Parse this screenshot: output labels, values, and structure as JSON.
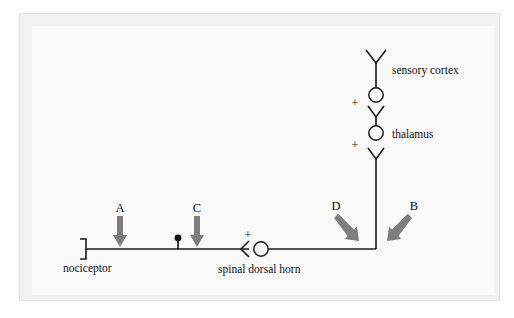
{
  "figure": {
    "domain": "diagram",
    "kind": "neural-pathway-schematic",
    "background_color": "#ffffff",
    "panel_color": "#fafafa",
    "frame_color": "#e2e2e2",
    "line_color": "#1a1a1a",
    "arrow_color": "#7e7e7e"
  },
  "pathway": {
    "nodes": [
      {
        "id": "nociceptor",
        "label": "nociceptor",
        "glyph": "bracket-terminal",
        "x": 86,
        "y": 249
      },
      {
        "id": "spinal-dorsal-horn",
        "label": "spinal dorsal horn",
        "glyph": "synapse-circle",
        "x": 261,
        "y": 249
      },
      {
        "id": "thalamus",
        "label": "thalamus",
        "glyph": "synapse-circle",
        "x": 376,
        "y": 133
      },
      {
        "id": "sensory-cortex",
        "label": "sensory cortex",
        "glyph": "synapse-circle",
        "x": 376,
        "y": 95
      }
    ],
    "synapse_signs": [
      {
        "id": "sign-dorsal-horn",
        "text": "+",
        "x": 248,
        "y": 239
      },
      {
        "id": "sign-thalamus",
        "text": "+",
        "x": 355,
        "y": 145
      },
      {
        "id": "sign-cortex",
        "text": "+",
        "x": 355,
        "y": 103
      }
    ],
    "varicosity": {
      "id": "axon-varicosity",
      "x": 178,
      "y": 238
    }
  },
  "annotations": {
    "arrows": [
      {
        "id": "arrow-a",
        "label": "A",
        "direction": "down",
        "label_x": 120,
        "label_y": 210
      },
      {
        "id": "arrow-c",
        "label": "C",
        "direction": "down",
        "label_x": 197,
        "label_y": 210
      },
      {
        "id": "arrow-d",
        "label": "D",
        "direction": "down-right",
        "label_x": 336,
        "label_y": 210
      },
      {
        "id": "arrow-b",
        "label": "B",
        "direction": "down-left",
        "label_x": 414,
        "label_y": 210
      }
    ]
  }
}
